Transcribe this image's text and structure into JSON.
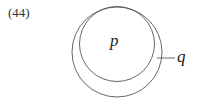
{
  "example_number": "(44)",
  "diagram": {
    "inner_label": "p",
    "outer_label": "q",
    "stroke_color": "#555555"
  }
}
